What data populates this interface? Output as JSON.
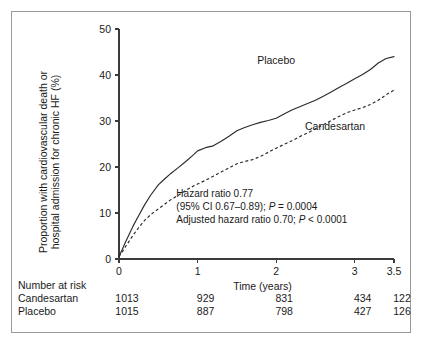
{
  "figure": {
    "type": "kaplan-meier-cumulative-event-plot"
  },
  "chart_data": {
    "type": "line",
    "title": "",
    "xlabel": "Time (years)",
    "ylabel_line1": "Proportion with cardiovascular death or",
    "ylabel_line2": "hospital admission for chronic HF (%)",
    "xlim": [
      0,
      3.5
    ],
    "ylim": [
      0,
      50
    ],
    "xticks": [
      0,
      1,
      2,
      3,
      3.5
    ],
    "xticklabels": [
      "0",
      "1",
      "2",
      "3",
      "3.5"
    ],
    "yticks": [
      0,
      10,
      20,
      30,
      40,
      50
    ],
    "yticklabels": [
      "0",
      "10",
      "20",
      "30",
      "40",
      "50"
    ],
    "grid": false,
    "legend_position": "inline-curve-labels",
    "series": [
      {
        "name": "Placebo",
        "style": "solid",
        "label_x": 2.0,
        "label_y": 42.5,
        "x": [
          0,
          0.04,
          0.08,
          0.13,
          0.18,
          0.25,
          0.32,
          0.4,
          0.5,
          0.58,
          0.66,
          0.75,
          0.85,
          0.95,
          1.0,
          1.1,
          1.2,
          1.3,
          1.4,
          1.5,
          1.6,
          1.7,
          1.8,
          1.9,
          2.0,
          2.1,
          2.2,
          2.3,
          2.4,
          2.5,
          2.6,
          2.7,
          2.8,
          2.9,
          3.0,
          3.1,
          3.2,
          3.3,
          3.4,
          3.5
        ],
        "y": [
          0.6,
          2.0,
          3.6,
          5.4,
          7.2,
          9.4,
          11.6,
          13.8,
          16.1,
          17.4,
          18.6,
          19.8,
          21.2,
          22.7,
          23.5,
          24.2,
          24.6,
          25.6,
          26.7,
          27.9,
          28.6,
          29.2,
          29.7,
          30.1,
          30.6,
          31.5,
          32.4,
          33.1,
          33.8,
          34.5,
          35.4,
          36.3,
          37.3,
          38.2,
          39.2,
          40.1,
          41.2,
          42.6,
          43.6,
          44.0
        ]
      },
      {
        "name": "Candesartan",
        "style": "dashed",
        "label_x": 2.75,
        "label_y": 28.0,
        "x": [
          0,
          0.04,
          0.08,
          0.13,
          0.18,
          0.25,
          0.32,
          0.4,
          0.5,
          0.58,
          0.66,
          0.75,
          0.85,
          0.95,
          1.0,
          1.1,
          1.2,
          1.3,
          1.4,
          1.5,
          1.6,
          1.7,
          1.8,
          1.9,
          2.0,
          2.1,
          2.2,
          2.3,
          2.4,
          2.5,
          2.6,
          2.7,
          2.8,
          2.9,
          3.0,
          3.1,
          3.2,
          3.3,
          3.4,
          3.5
        ],
        "y": [
          0.5,
          1.5,
          2.6,
          3.9,
          5.2,
          6.8,
          8.3,
          9.6,
          10.9,
          11.9,
          12.9,
          13.8,
          14.9,
          15.9,
          16.3,
          17.1,
          18.0,
          18.9,
          19.8,
          20.7,
          21.2,
          21.6,
          22.3,
          23.2,
          24.1,
          24.9,
          25.7,
          26.6,
          27.4,
          28.3,
          29.2,
          30.1,
          31.0,
          31.8,
          32.4,
          32.9,
          33.6,
          34.5,
          35.7,
          36.7
        ]
      }
    ],
    "annotations": [
      "Hazard ratio 0.77",
      "(95% CI 0.67–0.89); P = 0.0004",
      "Adjusted hazard ratio 0.70; P < 0.0001"
    ],
    "annotation_lines": [
      {
        "plain1": "Hazard ratio 0.77",
        "ital": "",
        "plain2": ""
      },
      {
        "plain1": "(95% CI 0.67–0.89); ",
        "ital": "P",
        "plain2": " = 0.0004"
      },
      {
        "plain1": "Adjusted hazard ratio 0.70; ",
        "ital": "P",
        "plain2": " < 0.0001"
      }
    ]
  },
  "risk_table": {
    "heading": "Number at risk",
    "time_points": [
      0,
      1,
      2,
      3,
      3.5
    ],
    "rows": [
      {
        "label": "Candesartan",
        "values": [
          "1013",
          "929",
          "831",
          "434",
          "122"
        ]
      },
      {
        "label": "Placebo",
        "values": [
          "1015",
          "887",
          "798",
          "427",
          "126"
        ]
      }
    ]
  },
  "colors": {
    "axis": "#3b3b3b",
    "curve": "#2b2b2b",
    "frame": "#9a9a9a",
    "text": "#1a1a1a",
    "background": "#ffffff"
  }
}
